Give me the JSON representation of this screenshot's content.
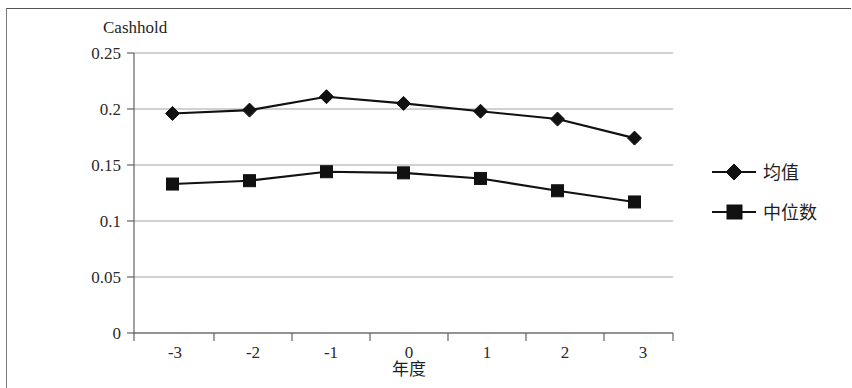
{
  "chart_data": {
    "type": "line",
    "title": "Cashhold",
    "subtitle": "",
    "xlabel": "年度",
    "ylabel": "",
    "categories": [
      "-3",
      "-2",
      "-1",
      "0",
      "1",
      "2",
      "3"
    ],
    "x": [
      -3,
      -2,
      -1,
      0,
      1,
      2,
      3
    ],
    "series": [
      {
        "name": "均值",
        "marker": "diamond",
        "color": "#111111",
        "values": [
          0.196,
          0.199,
          0.211,
          0.205,
          0.198,
          0.191,
          0.174
        ]
      },
      {
        "name": "中位数",
        "marker": "square",
        "color": "#111111",
        "values": [
          0.133,
          0.136,
          0.144,
          0.143,
          0.138,
          0.127,
          0.117
        ]
      }
    ],
    "ylim": [
      0,
      0.25
    ],
    "yticks": [
      "0",
      "0.05",
      "0.1",
      "0.15",
      "0.2",
      "0.25"
    ],
    "ytick_values": [
      0,
      0.05,
      0.1,
      0.15,
      0.2,
      0.25
    ],
    "xticks": [
      "-3",
      "-2",
      "-1",
      "0",
      "1",
      "2",
      "3"
    ],
    "grid": "horizontal",
    "legend_position": "right"
  },
  "axis": {
    "y_labels": [
      "0.25",
      "0.2",
      "0.15",
      "0.1",
      "0.05",
      "0"
    ],
    "x_labels": [
      "-3",
      "-2",
      "-1",
      "0",
      "1",
      "2",
      "3"
    ],
    "x_title": "年度"
  },
  "title": {
    "text": "Cashhold"
  },
  "legend": {
    "items": [
      {
        "label": "均值",
        "marker": "diamond-marker"
      },
      {
        "label": "中位数",
        "marker": "square-marker"
      }
    ]
  }
}
